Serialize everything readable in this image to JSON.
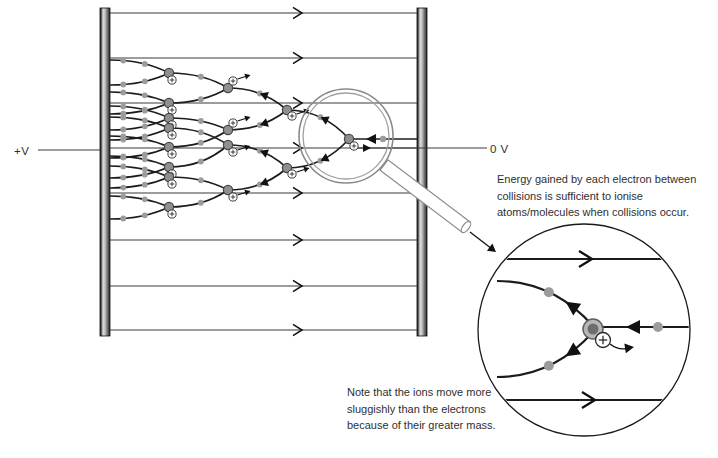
{
  "labels": {
    "plus_v": "+V",
    "zero_v": "0 V",
    "energy_note": "Energy gained by each electron between collisions is sufficient to ionise atoms/molecules when collisions occur.",
    "mass_note": "Note that the ions move more sluggishly than the electrons because of their greater mass."
  },
  "colors": {
    "field_line": "#3a3a3a",
    "branch": "#1c1c1c",
    "electron_dot": "#9c9c9c",
    "atom_fill": "#8f8f8f",
    "atom_stroke": "#454545",
    "ion_fill": "#ffffff",
    "ion_stroke": "#2a2a2a",
    "arrow": "#111111",
    "magnifier": "#8a8a8a",
    "inset_stroke": "#1a1a1a",
    "text": "#2f2f2f"
  },
  "figure": {
    "plates": {
      "left": {
        "x": 100,
        "y": 8,
        "w": 10,
        "h": 328
      },
      "right": {
        "x": 417,
        "y": 8,
        "w": 10,
        "h": 328
      }
    },
    "field_lines": {
      "x1": 110,
      "x2": 417,
      "ys": [
        13,
        58,
        103,
        148,
        193,
        240,
        286,
        330
      ],
      "arrow_tip_x": 302
    },
    "voltage_leads": {
      "left": {
        "x1": 38,
        "x2": 100,
        "y": 150
      },
      "right": {
        "x1": 357,
        "x2": 487,
        "y": 148,
        "arrow_tip_x": 371
      }
    },
    "tree": {
      "seed_line": {
        "x1": 417,
        "y": 139,
        "x2": 353,
        "dot": [
          383,
          139
        ],
        "arrow_tip": [
          366,
          139
        ]
      },
      "junctions": [
        {
          "id": "J0",
          "x": 349,
          "y": 139,
          "ion": [
            354,
            146
          ],
          "ion_arrow": false
        },
        {
          "id": "J1a",
          "x": 287,
          "y": 110,
          "ion": [
            292,
            116
          ],
          "ion_arrow": true
        },
        {
          "id": "J1b",
          "x": 287,
          "y": 168,
          "ion": [
            292,
            174
          ],
          "ion_arrow": true
        },
        {
          "id": "J2a",
          "x": 228,
          "y": 88,
          "ion": [
            233,
            81
          ],
          "ion_arrow": true
        },
        {
          "id": "J2b",
          "x": 228,
          "y": 130,
          "ion": [
            233,
            123
          ],
          "ion_arrow": true
        },
        {
          "id": "J2c",
          "x": 228,
          "y": 145,
          "ion": [
            233,
            152
          ],
          "ion_arrow": true
        },
        {
          "id": "J2d",
          "x": 228,
          "y": 190,
          "ion": [
            233,
            197
          ],
          "ion_arrow": true
        },
        {
          "id": "J3a",
          "x": 169,
          "y": 73,
          "ion": [
            172,
            80
          ],
          "ion_arrow": false
        },
        {
          "id": "J3b",
          "x": 169,
          "y": 103,
          "ion": [
            172,
            110
          ],
          "ion_arrow": false
        },
        {
          "id": "J3c",
          "x": 169,
          "y": 118,
          "ion": [
            172,
            125
          ],
          "ion_arrow": false
        },
        {
          "id": "J3d",
          "x": 169,
          "y": 147,
          "ion": [
            172,
            154
          ],
          "ion_arrow": false
        },
        {
          "id": "J3e",
          "x": 169,
          "y": 128,
          "ion": [
            172,
            135
          ],
          "ion_arrow": false
        },
        {
          "id": "J3f",
          "x": 169,
          "y": 167,
          "ion": [
            172,
            174
          ],
          "ion_arrow": false
        },
        {
          "id": "J3g",
          "x": 169,
          "y": 177,
          "ion": [
            172,
            184
          ],
          "ion_arrow": false
        },
        {
          "id": "J3h",
          "x": 169,
          "y": 207,
          "ion": [
            172,
            214
          ],
          "ion_arrow": false
        }
      ],
      "links": [
        {
          "from": "J0",
          "to": "J1a",
          "arrow": true
        },
        {
          "from": "J0",
          "to": "J1b",
          "arrow": true
        },
        {
          "from": "J1a",
          "to": "J2a",
          "arrow": true
        },
        {
          "from": "J1a",
          "to": "J2b",
          "arrow": true
        },
        {
          "from": "J1b",
          "to": "J2c",
          "arrow": true
        },
        {
          "from": "J1b",
          "to": "J2d",
          "arrow": true
        },
        {
          "from": "J2a",
          "to": "J3a",
          "arrow": false
        },
        {
          "from": "J2a",
          "to": "J3b",
          "arrow": false
        },
        {
          "from": "J2b",
          "to": "J3c",
          "arrow": false
        },
        {
          "from": "J2b",
          "to": "J3d",
          "arrow": false
        },
        {
          "from": "J2c",
          "to": "J3e",
          "arrow": false
        },
        {
          "from": "J2c",
          "to": "J3f",
          "arrow": false
        },
        {
          "from": "J2d",
          "to": "J3g",
          "arrow": false
        },
        {
          "from": "J2d",
          "to": "J3h",
          "arrow": false
        }
      ],
      "terminals": [
        {
          "from": "J3a",
          "to": [
            110,
            60
          ]
        },
        {
          "from": "J3a",
          "to": [
            110,
            85
          ]
        },
        {
          "from": "J3b",
          "to": [
            110,
            92
          ]
        },
        {
          "from": "J3b",
          "to": [
            110,
            114
          ]
        },
        {
          "from": "J3c",
          "to": [
            110,
            106
          ]
        },
        {
          "from": "J3c",
          "to": [
            110,
            130
          ]
        },
        {
          "from": "J3d",
          "to": [
            110,
            136
          ]
        },
        {
          "from": "J3d",
          "to": [
            110,
            158
          ]
        },
        {
          "from": "J3e",
          "to": [
            110,
            117
          ]
        },
        {
          "from": "J3e",
          "to": [
            110,
            140
          ]
        },
        {
          "from": "J3f",
          "to": [
            110,
            156
          ]
        },
        {
          "from": "J3f",
          "to": [
            110,
            178
          ]
        },
        {
          "from": "J3g",
          "to": [
            110,
            166
          ]
        },
        {
          "from": "J3g",
          "to": [
            110,
            188
          ]
        },
        {
          "from": "J3h",
          "to": [
            110,
            196
          ]
        },
        {
          "from": "J3h",
          "to": [
            110,
            219
          ]
        }
      ]
    },
    "magnifier": {
      "cx": 346,
      "cy": 136,
      "r_outer": 47,
      "r_inner": 43,
      "handle": {
        "x1": 384,
        "y1": 165,
        "x2": 466,
        "y2": 227,
        "half_width": 6.5
      },
      "pointer": {
        "x1": 470,
        "y1": 232,
        "tip": [
          496,
          252
        ]
      }
    },
    "inset": {
      "cx": 584,
      "cy": 330,
      "r": 106,
      "field_lines": [
        {
          "y": 259,
          "arrow_tip_x": 592
        },
        {
          "y": 400,
          "arrow_tip_x": 595
        }
      ],
      "seed": {
        "y": 327,
        "x2": 692,
        "atom_x": 600,
        "dot": [
          658,
          327
        ],
        "arrow_tip": [
          626,
          327
        ]
      },
      "branches": [
        {
          "tip": [
            497,
            281
          ],
          "root": [
            593,
            326
          ]
        },
        {
          "tip": [
            497,
            377
          ],
          "root": [
            593,
            332
          ]
        }
      ],
      "atom": {
        "x": 593,
        "y": 329,
        "r_outer": 10,
        "r_inner": 5.5
      },
      "ion": {
        "x": 603,
        "y": 340,
        "r": 7.5,
        "arrow_tip": [
          634,
          347
        ]
      }
    }
  }
}
